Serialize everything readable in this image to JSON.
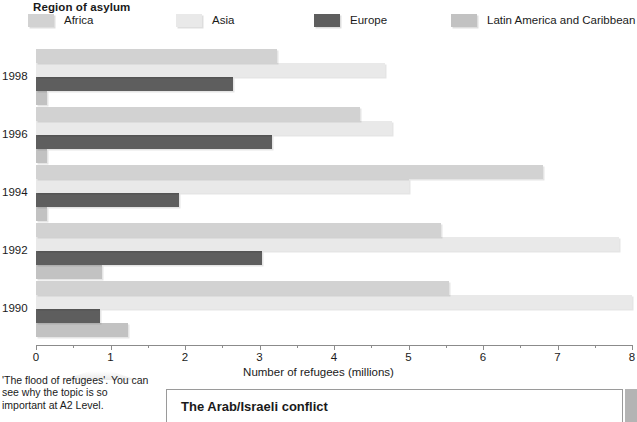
{
  "legend": {
    "title": "Region of asylum",
    "items": [
      {
        "label": "Africa",
        "color": "#d2d2d2"
      },
      {
        "label": "Asia",
        "color": "#e9e9e9"
      },
      {
        "label": "Europe",
        "color": "#5e5e5e"
      },
      {
        "label": "Latin America and Caribbean",
        "color": "#c2c2c2"
      }
    ]
  },
  "chart_data": {
    "type": "bar",
    "orientation": "horizontal",
    "title": "Region of asylum",
    "xlabel": "Number of refugees (millions)",
    "ylabel": "",
    "xlim": [
      0,
      8
    ],
    "xticks": [
      0,
      1,
      2,
      3,
      4,
      5,
      6,
      7,
      8
    ],
    "xticklabels": [
      "0",
      "1",
      "2",
      "3",
      "4",
      "5",
      "6",
      "7",
      "8"
    ],
    "minor_ticks": [
      0.5,
      1.5,
      2.5,
      3.5,
      4.5,
      5.5,
      6.5,
      7.5
    ],
    "grid": false,
    "legend_position": "top",
    "categories": [
      "1998",
      "1996",
      "1994",
      "1992",
      "1990"
    ],
    "series": [
      {
        "name": "Africa",
        "color": "#d2d2d2",
        "values": [
          3.24,
          4.35,
          6.8,
          5.43,
          5.55
        ]
      },
      {
        "name": "Asia",
        "color": "#e9e9e9",
        "values": [
          4.69,
          4.78,
          5.0,
          7.82,
          8.0
        ]
      },
      {
        "name": "Europe",
        "color": "#5e5e5e",
        "values": [
          2.64,
          3.17,
          1.92,
          3.04,
          0.86
        ]
      },
      {
        "name": "Latin America and Caribbean",
        "color": "#c2c2c2",
        "values": [
          0.15,
          0.15,
          0.15,
          0.89,
          1.24
        ]
      }
    ]
  },
  "footnote": {
    "text": "'The flood of refugees'. You can see why the topic is so important at A2 Level."
  },
  "bottom_box": {
    "title": "The Arab/Israeli conflict"
  }
}
